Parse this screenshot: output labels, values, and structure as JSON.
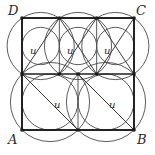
{
  "figure": {
    "type": "geometry-diagram",
    "background_color": "#ffffff",
    "square_stroke_color": "#1a1a1a",
    "circle_stroke_color": "#4a4a4a",
    "label_color": "#2a2a2a",
    "outer_square": {
      "x": 22,
      "y": 18,
      "width": 112,
      "height": 112
    },
    "corner_labels": [
      {
        "text": "D",
        "x": 8,
        "y": 4,
        "vertex_x": 22,
        "vertex_y": 18
      },
      {
        "text": "C",
        "x": 136,
        "y": 4,
        "vertex_x": 134,
        "vertex_y": 18
      },
      {
        "text": "A",
        "x": 8,
        "y": 133,
        "vertex_x": 22,
        "vertex_y": 130
      },
      {
        "text": "B",
        "x": 137,
        "y": 133,
        "vertex_x": 134,
        "vertex_y": 130
      }
    ],
    "side_labels": [
      {
        "text": "u",
        "x": 30,
        "y": 46
      },
      {
        "text": "u",
        "x": 67,
        "y": 46
      },
      {
        "text": "u",
        "x": 104,
        "y": 46
      },
      {
        "text": "u",
        "x": 54,
        "y": 100
      },
      {
        "text": "u",
        "x": 109,
        "y": 100
      }
    ],
    "top_row": {
      "count": 3,
      "square_side": 37.33,
      "top_y": 18,
      "bottom_y": 74,
      "x_positions": [
        22,
        59.33,
        96.67
      ]
    },
    "bottom_row": {
      "count": 2,
      "square_side": 56,
      "top_y": 74,
      "bottom_y": 130,
      "x_positions": [
        22,
        78
      ]
    },
    "midline_y": 74
  }
}
